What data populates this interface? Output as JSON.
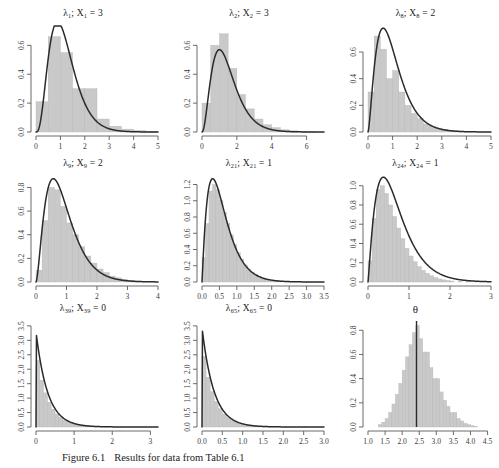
{
  "figure": {
    "caption_label": "Figure 6.1",
    "caption_text": "Results for data from Table 6.1"
  },
  "chart_data": [
    {
      "type": "bar",
      "title": "λ₁; X₁ = 3",
      "title_symbol": "λ",
      "title_sub1": "1",
      "title_var": "X",
      "title_sub2": "1",
      "title_value": "3",
      "xlabel": "",
      "ylabel": "",
      "xlim": [
        0,
        5
      ],
      "ylim": [
        0,
        0.72
      ],
      "xticks": [
        0,
        1,
        2,
        3,
        4,
        5
      ],
      "yticks": [
        0.0,
        0.2,
        0.4,
        0.6
      ],
      "ytick_labels": [
        "0.0",
        "0.2",
        "0.4",
        "0.6"
      ],
      "xtick_labels": [
        "0",
        "1",
        "2",
        "3",
        "4",
        "5"
      ],
      "bin_width": 0.5,
      "bin_starts": [
        0.0,
        0.5,
        1.0,
        1.5,
        2.0,
        2.5,
        3.0,
        3.5,
        4.0,
        4.5
      ],
      "values": [
        0.21,
        0.66,
        0.55,
        0.3,
        0.3,
        0.09,
        0.04,
        0.02,
        0.01,
        0.004
      ],
      "curve_name": "gamma density",
      "curve_shape": 4.0,
      "curve_rate": 3.4,
      "grid": false,
      "legend": "none"
    },
    {
      "type": "bar",
      "title": "λ₂; X₂ = 3",
      "title_symbol": "λ",
      "title_sub1": "2",
      "title_var": "X",
      "title_sub2": "2",
      "title_value": "3",
      "xlabel": "",
      "ylabel": "",
      "xlim": [
        0,
        7
      ],
      "ylim": [
        0,
        0.72
      ],
      "xticks": [
        0,
        2,
        4,
        6
      ],
      "yticks": [
        0.0,
        0.2,
        0.4,
        0.6
      ],
      "ytick_labels": [
        "0.0",
        "0.2",
        "0.4",
        "0.6"
      ],
      "xtick_labels": [
        "0",
        "2",
        "4",
        "6"
      ],
      "bin_width": 0.5,
      "bin_starts": [
        0.0,
        0.5,
        1.0,
        1.5,
        2.0,
        2.5,
        3.0,
        3.5,
        4.0,
        4.5,
        5.0,
        5.5,
        6.0
      ],
      "values": [
        0.2,
        0.6,
        0.68,
        0.44,
        0.26,
        0.16,
        0.09,
        0.05,
        0.03,
        0.015,
        0.008,
        0.004,
        0.002
      ],
      "curve_name": "gamma density",
      "curve_shape": 3.2,
      "curve_rate": 2.2,
      "grid": false,
      "legend": "none"
    },
    {
      "type": "bar",
      "title": "λ₈; X₈ = 2",
      "title_symbol": "λ",
      "title_sub1": "8",
      "title_var": "X",
      "title_sub2": "8",
      "title_value": "2",
      "xlabel": "",
      "ylabel": "",
      "xlim": [
        0,
        5
      ],
      "ylim": [
        0,
        0.78
      ],
      "xticks": [
        0,
        1,
        2,
        3,
        4,
        5
      ],
      "yticks": [
        0.0,
        0.2,
        0.4,
        0.6
      ],
      "ytick_labels": [
        "0.0",
        "0.2",
        "0.4",
        "0.6"
      ],
      "xtick_labels": [
        "0",
        "1",
        "2",
        "3",
        "4",
        "5"
      ],
      "bin_width": 0.25,
      "bin_starts": [
        0.0,
        0.25,
        0.5,
        0.75,
        1.0,
        1.25,
        1.5,
        1.75,
        2.0,
        2.25,
        2.5,
        2.75,
        3.0,
        3.25,
        3.5,
        3.75,
        4.0
      ],
      "values": [
        0.3,
        0.72,
        0.62,
        0.4,
        0.46,
        0.3,
        0.2,
        0.14,
        0.1,
        0.06,
        0.04,
        0.03,
        0.02,
        0.012,
        0.008,
        0.005,
        0.003
      ],
      "curve_name": "gamma density",
      "curve_shape": 2.6,
      "curve_rate": 2.6,
      "grid": false,
      "legend": "none"
    },
    {
      "type": "bar",
      "title": "λ₉; X₉ = 2",
      "title_symbol": "λ",
      "title_sub1": "9",
      "title_var": "X",
      "title_sub2": "9",
      "title_value": "2",
      "xlabel": "",
      "ylabel": "",
      "xlim": [
        0,
        4
      ],
      "ylim": [
        0,
        0.88
      ],
      "xticks": [
        0,
        1,
        2,
        3,
        4
      ],
      "yticks": [
        0.0,
        0.2,
        0.4,
        0.6,
        0.8
      ],
      "ytick_labels": [
        "0.0",
        "0.2",
        "0.4",
        "0.6",
        "0.8"
      ],
      "xtick_labels": [
        "0",
        "1",
        "2",
        "3",
        "4"
      ],
      "bin_width": 0.2,
      "bin_starts": [
        0.0,
        0.2,
        0.4,
        0.6,
        0.8,
        1.0,
        1.2,
        1.4,
        1.6,
        1.8,
        2.0,
        2.2,
        2.4,
        2.6,
        2.8,
        3.0,
        3.2,
        3.4
      ],
      "values": [
        0.1,
        0.52,
        0.8,
        0.78,
        0.64,
        0.5,
        0.4,
        0.3,
        0.22,
        0.16,
        0.11,
        0.08,
        0.05,
        0.035,
        0.022,
        0.014,
        0.008,
        0.004
      ],
      "curve_name": "gamma density",
      "curve_shape": 2.7,
      "curve_rate": 3.0,
      "grid": false,
      "legend": "none"
    },
    {
      "type": "bar",
      "title": "λ₂₁; X₂₁ = 1",
      "title_symbol": "λ",
      "title_sub1": "21",
      "title_var": "X",
      "title_sub2": "21",
      "title_value": "1",
      "xlabel": "",
      "ylabel": "",
      "xlim": [
        0,
        3.5
      ],
      "ylim": [
        0,
        1.28
      ],
      "xticks": [
        0.0,
        0.5,
        1.0,
        1.5,
        2.0,
        2.5,
        3.0,
        3.5
      ],
      "yticks": [
        0.0,
        0.2,
        0.4,
        0.6,
        0.8,
        1.0,
        1.2
      ],
      "ytick_labels": [
        "0.0",
        "0.2",
        "0.4",
        "0.6",
        "0.8",
        "1.0",
        "1.2"
      ],
      "xtick_labels": [
        "0.0",
        "0.5",
        "1.0",
        "1.5",
        "2.0",
        "2.5",
        "3.0",
        "3.5"
      ],
      "bin_width": 0.1,
      "bin_starts": [
        0.0,
        0.1,
        0.2,
        0.3,
        0.4,
        0.5,
        0.6,
        0.7,
        0.8,
        0.9,
        1.0,
        1.1,
        1.2,
        1.3,
        1.4,
        1.5,
        1.6,
        1.7,
        1.8,
        1.9,
        2.0,
        2.1,
        2.2,
        2.4,
        2.6,
        2.8,
        3.0
      ],
      "values": [
        0.3,
        0.72,
        1.12,
        1.2,
        1.14,
        1.0,
        0.86,
        0.72,
        0.58,
        0.46,
        0.36,
        0.28,
        0.21,
        0.16,
        0.12,
        0.09,
        0.07,
        0.05,
        0.035,
        0.025,
        0.018,
        0.012,
        0.008,
        0.005,
        0.003,
        0.002,
        0.001
      ],
      "curve_name": "gamma density",
      "curve_shape": 2.1,
      "curve_rate": 3.6,
      "grid": false,
      "legend": "none"
    },
    {
      "type": "bar",
      "title": "λ₂₄; X₂₄ = 1",
      "title_symbol": "λ",
      "title_sub1": "24",
      "title_var": "X",
      "title_sub2": "24",
      "title_value": "1",
      "xlabel": "",
      "ylabel": "",
      "xlim": [
        0,
        3
      ],
      "ylim": [
        0,
        1.08
      ],
      "xticks": [
        0,
        1,
        2,
        3
      ],
      "yticks": [
        0.0,
        0.2,
        0.4,
        0.6,
        0.8,
        1.0
      ],
      "ytick_labels": [
        "0.0",
        "0.2",
        "0.4",
        "0.6",
        "0.8",
        "1.0"
      ],
      "xtick_labels": [
        "0",
        "1",
        "2",
        "3"
      ],
      "bin_width": 0.1,
      "bin_starts": [
        0.0,
        0.1,
        0.2,
        0.3,
        0.4,
        0.5,
        0.6,
        0.7,
        0.8,
        0.9,
        1.0,
        1.1,
        1.2,
        1.3,
        1.4,
        1.5,
        1.6,
        1.7,
        1.8,
        1.9,
        2.0,
        2.2,
        2.4,
        2.6
      ],
      "values": [
        0.22,
        0.66,
        0.96,
        1.0,
        0.92,
        0.8,
        0.68,
        0.56,
        0.45,
        0.35,
        0.27,
        0.21,
        0.16,
        0.12,
        0.09,
        0.065,
        0.046,
        0.032,
        0.022,
        0.015,
        0.01,
        0.006,
        0.003,
        0.002
      ],
      "curve_name": "gamma density",
      "curve_shape": 2.2,
      "curve_rate": 3.2,
      "grid": false,
      "legend": "none"
    },
    {
      "type": "bar",
      "title": "λ₃₉; X₃₉ = 0",
      "title_symbol": "λ",
      "title_sub1": "39",
      "title_var": "X",
      "title_sub2": "39",
      "title_value": "0",
      "xlabel": "",
      "ylabel": "",
      "xlim": [
        0,
        3.2
      ],
      "ylim": [
        0,
        3.6
      ],
      "xticks": [
        0,
        1,
        2,
        3
      ],
      "yticks": [
        0.0,
        0.5,
        1.0,
        1.5,
        2.0,
        2.5,
        3.0,
        3.5
      ],
      "ytick_labels": [
        "0.0",
        "0.5",
        "1.0",
        "1.5",
        "2.0",
        "2.5",
        "3.0",
        "3.5"
      ],
      "xtick_labels": [
        "0",
        "1",
        "2",
        "3"
      ],
      "bin_width": 0.1,
      "bin_starts": [
        0.0,
        0.1,
        0.2,
        0.3,
        0.4,
        0.5,
        0.6,
        0.7,
        0.8,
        0.9,
        1.0,
        1.1,
        1.2,
        1.3,
        1.4,
        1.5,
        1.6,
        1.8,
        2.0,
        2.2,
        2.5,
        2.8
      ],
      "values": [
        2.3,
        1.62,
        1.18,
        0.86,
        0.62,
        0.45,
        0.33,
        0.24,
        0.17,
        0.125,
        0.09,
        0.065,
        0.047,
        0.034,
        0.025,
        0.018,
        0.012,
        0.007,
        0.004,
        0.002,
        0.001,
        0.0006
      ],
      "curve_name": "exponential density",
      "curve_shape": 1.0,
      "curve_rate": 3.3,
      "grid": false,
      "legend": "none"
    },
    {
      "type": "bar",
      "title": "λ₆₅; X₆₅ = 0",
      "title_symbol": "λ",
      "title_sub1": "65",
      "title_var": "X",
      "title_sub2": "65",
      "title_value": "0",
      "xlabel": "",
      "ylabel": "",
      "xlim": [
        0,
        3
      ],
      "ylim": [
        0,
        3.6
      ],
      "xticks": [
        0.0,
        0.5,
        1.0,
        1.5,
        2.0,
        2.5,
        3.0
      ],
      "yticks": [
        0.0,
        0.5,
        1.0,
        1.5,
        2.0,
        2.5,
        3.0,
        3.5
      ],
      "ytick_labels": [
        "0.0",
        "0.5",
        "1.0",
        "1.5",
        "2.0",
        "2.5",
        "3.0",
        "3.5"
      ],
      "xtick_labels": [
        "0.0",
        "0.5",
        "1.0",
        "1.5",
        "2.0",
        "2.5",
        "3.0"
      ],
      "bin_width": 0.1,
      "bin_starts": [
        0.0,
        0.1,
        0.2,
        0.3,
        0.4,
        0.5,
        0.6,
        0.7,
        0.8,
        0.9,
        1.0,
        1.1,
        1.2,
        1.3,
        1.4,
        1.5,
        1.6,
        1.8,
        2.0,
        2.2,
        2.5
      ],
      "values": [
        2.45,
        1.72,
        1.22,
        0.88,
        0.63,
        0.45,
        0.32,
        0.23,
        0.165,
        0.118,
        0.085,
        0.06,
        0.043,
        0.031,
        0.022,
        0.016,
        0.011,
        0.006,
        0.003,
        0.0015,
        0.0008
      ],
      "curve_name": "exponential density",
      "curve_shape": 1.0,
      "curve_rate": 3.45,
      "grid": false,
      "legend": "none"
    },
    {
      "type": "bar",
      "title": "θ",
      "title_symbol": "θ",
      "title_sub1": "",
      "title_var": "",
      "title_sub2": "",
      "title_value": "",
      "xlabel": "",
      "ylabel": "",
      "xlim": [
        1.0,
        4.6
      ],
      "ylim": [
        0,
        0.86
      ],
      "xticks": [
        1.0,
        1.5,
        2.0,
        2.5,
        3.0,
        3.5,
        4.0,
        4.5
      ],
      "yticks": [
        0.0,
        0.2,
        0.4,
        0.6,
        0.8
      ],
      "ytick_labels": [
        "0.0",
        "0.2",
        "0.4",
        "0.6",
        "0.8"
      ],
      "xtick_labels": [
        "1.0",
        "1.5",
        "2.0",
        "2.5",
        "3.0",
        "3.5",
        "4.0",
        "4.5"
      ],
      "bin_width": 0.1,
      "bin_starts": [
        1.3,
        1.4,
        1.5,
        1.6,
        1.7,
        1.8,
        1.9,
        2.0,
        2.1,
        2.2,
        2.3,
        2.4,
        2.5,
        2.6,
        2.7,
        2.8,
        2.9,
        3.0,
        3.1,
        3.2,
        3.3,
        3.4,
        3.5,
        3.6,
        3.7,
        3.8,
        3.9,
        4.0,
        4.1
      ],
      "values": [
        0.02,
        0.04,
        0.07,
        0.12,
        0.19,
        0.27,
        0.36,
        0.47,
        0.58,
        0.68,
        0.78,
        0.84,
        0.73,
        0.62,
        0.62,
        0.49,
        0.4,
        0.4,
        0.29,
        0.22,
        0.17,
        0.12,
        0.12,
        0.07,
        0.05,
        0.03,
        0.02,
        0.012,
        0.006
      ],
      "vline_value": 2.42,
      "curve_name": "none",
      "grid": false,
      "legend": "none"
    }
  ]
}
